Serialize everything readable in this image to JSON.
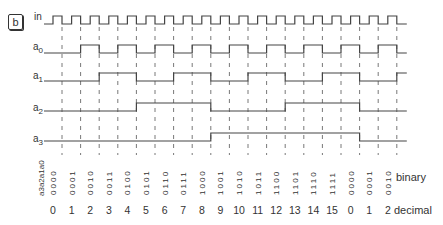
{
  "panel_label": "b",
  "signals": [
    {
      "name": "in",
      "sub": ""
    },
    {
      "name": "a",
      "sub": "0"
    },
    {
      "name": "a",
      "sub": "1"
    },
    {
      "name": "a",
      "sub": "2"
    },
    {
      "name": "a",
      "sub": "3"
    }
  ],
  "column_header": "a3a2a1a0",
  "binary_values": [
    "0000",
    "0001",
    "0010",
    "0011",
    "0100",
    "0101",
    "0110",
    "0111",
    "1000",
    "1001",
    "1010",
    "1011",
    "1100",
    "1101",
    "1110",
    "1111",
    "0000",
    "0001",
    "0010"
  ],
  "decimal_values": [
    "0",
    "1",
    "2",
    "3",
    "4",
    "5",
    "6",
    "7",
    "8",
    "9",
    "10",
    "11",
    "12",
    "13",
    "14",
    "15",
    "0",
    "1",
    "2"
  ],
  "row_labels": {
    "binary": "binary",
    "decimal": "decimal"
  }
}
